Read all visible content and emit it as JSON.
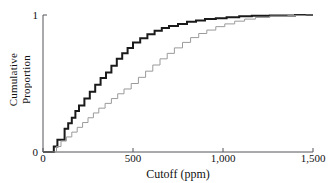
{
  "chart_data": {
    "type": "line",
    "title": "",
    "xlabel": "Cutoff (ppm)",
    "ylabel": "Cumulative Proportion",
    "ylabel_lines": [
      "Cumulative",
      "Proportion"
    ],
    "xlim": [
      0,
      1500
    ],
    "ylim": [
      0,
      1
    ],
    "xticks": [
      0,
      500,
      1000,
      1500
    ],
    "xtick_labels": [
      "0",
      "500",
      "1,000",
      "1,500"
    ],
    "yticks": [
      0,
      1
    ],
    "ytick_labels": [
      "0",
      "1"
    ],
    "grid": false,
    "legend": "none",
    "drawstyle": "steps-post",
    "series": [
      {
        "name": "dark-step-curve",
        "color": "#1a1a1a",
        "line_width": 2.0,
        "x": [
          0,
          40,
          60,
          80,
          100,
          120,
          140,
          160,
          180,
          200,
          230,
          260,
          290,
          320,
          350,
          380,
          410,
          440,
          470,
          500,
          540,
          580,
          620,
          660,
          700,
          750,
          800,
          850,
          900,
          960,
          1020,
          1090,
          1160,
          1260,
          1400,
          1500
        ],
        "y": [
          0.0,
          0.0,
          0.04,
          0.09,
          0.09,
          0.17,
          0.21,
          0.25,
          0.3,
          0.34,
          0.39,
          0.44,
          0.49,
          0.54,
          0.58,
          0.63,
          0.68,
          0.72,
          0.76,
          0.8,
          0.83,
          0.86,
          0.885,
          0.905,
          0.92,
          0.935,
          0.95,
          0.96,
          0.97,
          0.977,
          0.984,
          0.99,
          0.994,
          0.997,
          1.0,
          1.0
        ]
      },
      {
        "name": "light-step-curve",
        "color": "#9a9a9a",
        "line_width": 1.0,
        "x": [
          0,
          50,
          75,
          100,
          130,
          160,
          190,
          220,
          250,
          280,
          310,
          345,
          380,
          415,
          450,
          490,
          530,
          570,
          610,
          650,
          690,
          730,
          775,
          820,
          865,
          910,
          960,
          1010,
          1065,
          1120,
          1180,
          1260,
          1360,
          1460,
          1500
        ],
        "y": [
          0.0,
          0.0,
          0.04,
          0.08,
          0.11,
          0.145,
          0.18,
          0.215,
          0.25,
          0.285,
          0.32,
          0.355,
          0.39,
          0.425,
          0.46,
          0.5,
          0.545,
          0.59,
          0.635,
          0.68,
          0.72,
          0.76,
          0.8,
          0.835,
          0.865,
          0.89,
          0.915,
          0.935,
          0.955,
          0.97,
          0.982,
          0.992,
          0.997,
          1.0,
          1.0
        ]
      }
    ]
  },
  "axes": {
    "x_title": "Cutoff (ppm)",
    "y_title_line1": "Cumulative",
    "y_title_line2": "Proportion",
    "x_tick_0": "0",
    "x_tick_500": "500",
    "x_tick_1000": "1,000",
    "x_tick_1500": "1,500",
    "y_tick_0": "0",
    "y_tick_1": "1"
  },
  "colors": {
    "axis": "#55555a",
    "dark_curve": "#1a1a1a",
    "light_curve": "#9a9a9a",
    "text": "#111111",
    "background": "#ffffff"
  }
}
